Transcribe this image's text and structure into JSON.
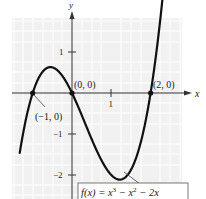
{
  "chart_data": {
    "type": "line",
    "title": "",
    "xlabel": "x",
    "ylabel": "y",
    "function": "f(x) = x^3 - x^2 - 2x",
    "legend_label": "f(x) = x³ − x² − 2x",
    "xlim": [
      -1.5,
      2.8
    ],
    "ylim": [
      -2.6,
      2.0
    ],
    "x_ticks": [
      1
    ],
    "x_tick_labels": [
      "1"
    ],
    "y_ticks": [
      1,
      -1,
      -2
    ],
    "y_tick_labels": [
      "1",
      "−1",
      "−2"
    ],
    "grid": true,
    "points": [
      {
        "x": -1,
        "y": 0,
        "label": "(−1, 0)"
      },
      {
        "x": 0,
        "y": 0,
        "label": "(0, 0)"
      },
      {
        "x": 2,
        "y": 0,
        "label": "(2, 0)"
      }
    ],
    "series": [
      {
        "name": "f(x) = x³ − x² − 2x",
        "x": [
          -1.3,
          -1.0,
          -0.5,
          -0.22,
          0,
          0.5,
          1.0,
          1.22,
          1.5,
          2.0,
          2.3
        ],
        "y": [
          -1.287,
          0,
          0.625,
          0.63,
          0,
          -1.125,
          -2.0,
          -2.11,
          -1.875,
          0,
          1.587
        ]
      }
    ]
  },
  "labels": {
    "x_axis": "x",
    "y_axis": "y",
    "x_tick_1": "1",
    "y_tick_1": "1",
    "y_tick_neg1": "−1",
    "y_tick_neg2": "−2",
    "pt_neg1": "(−1, 0)",
    "pt_0": "(0, 0)",
    "pt_2": "(2, 0)",
    "func_prefix": "f(x) = x",
    "func_sup1": "3",
    "func_mid": " − x",
    "func_sup2": "2",
    "func_suffix": " − 2x"
  }
}
